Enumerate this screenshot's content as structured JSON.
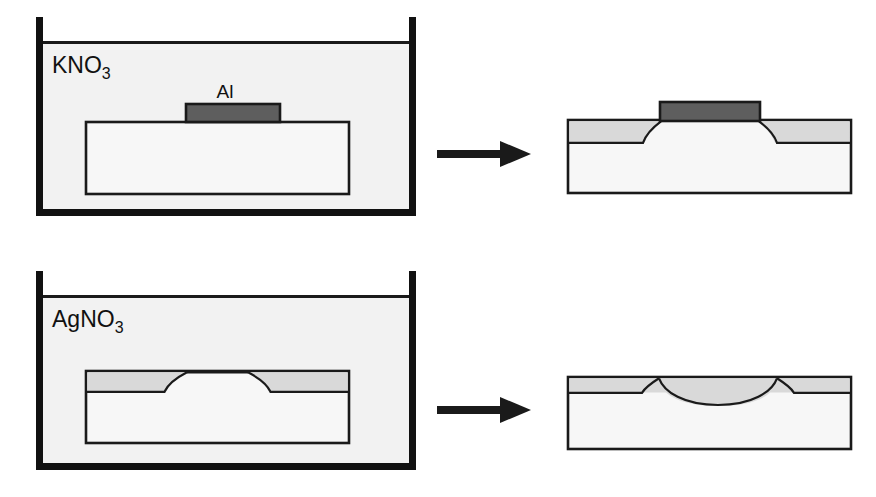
{
  "figure": {
    "title_visible": false,
    "background_color": "#ffffff",
    "width": 876,
    "height": 497
  },
  "colors": {
    "outline": "#1a1a1a",
    "beaker_wall": "#111111",
    "solution_fill": "#f2f2f2",
    "substrate_fill": "#f7f7f7",
    "diffusion_layer": "#d9d9d9",
    "aluminum_bar": "#5e5e5e",
    "arrow": "#1a1a1a",
    "text": "#111111"
  },
  "rows": [
    {
      "id": "row-kno3",
      "beaker": {
        "label": "KNO",
        "label_subscript": "3",
        "label_full": "KNO3"
      },
      "left_panel": {
        "name": "kno3-beaker-panel",
        "substrate_label": "",
        "aluminum": {
          "label": "Al",
          "present": true
        },
        "diffusion_layer_present": false
      },
      "arrow": {
        "name": "process-arrow-top",
        "direction": "right"
      },
      "right_panel": {
        "name": "kno3-result-panel",
        "aluminum": {
          "label": "Al",
          "present": true
        },
        "diffusion_layer_present": true,
        "diffusion_profile": "masked-edges-curving-under-aluminum"
      }
    },
    {
      "id": "row-agno3",
      "beaker": {
        "label": "AgNO",
        "label_subscript": "3",
        "label_full": "AgNO3"
      },
      "left_panel": {
        "name": "agno3-beaker-panel",
        "aluminum": {
          "label": "Al",
          "present": false
        },
        "diffusion_layer_present": true,
        "diffusion_profile": "two-side-regions-with-central-gap"
      },
      "arrow": {
        "name": "process-arrow-bottom",
        "direction": "right"
      },
      "right_panel": {
        "name": "agno3-result-panel",
        "aluminum": {
          "label": "Al",
          "present": false
        },
        "diffusion_layer_present": true,
        "diffusion_profile": "merged-layer-with-central-arc"
      }
    }
  ]
}
